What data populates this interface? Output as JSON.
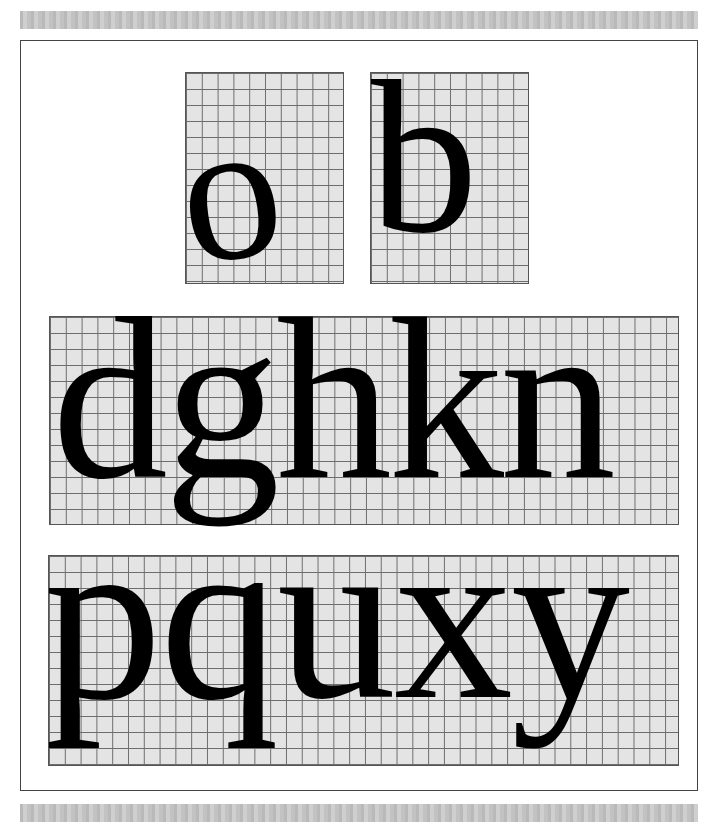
{
  "panels": [
    {
      "id": "o",
      "letters": "o"
    },
    {
      "id": "b",
      "letters": "b"
    },
    {
      "id": "row2",
      "letters": "dghkn"
    },
    {
      "id": "row3",
      "letters": "pquxy"
    }
  ],
  "colors": {
    "grid_background": "#e4e4e4",
    "grid_lines": "#6d6d6d",
    "glyph": "#000000",
    "frame": "#444444",
    "strip": "#c2c2c2"
  }
}
